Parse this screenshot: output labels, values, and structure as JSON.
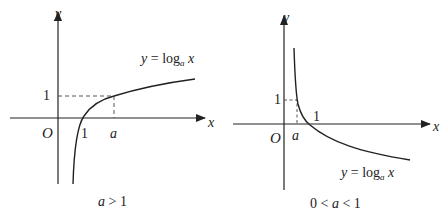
{
  "figures": [
    {
      "id": "left",
      "condition": "a > 1",
      "condition_parts": {
        "a": "a",
        "op": " > ",
        "one": "1"
      },
      "function_label": {
        "y": "y",
        "eq": " = ",
        "log": "log",
        "base": "a",
        "x": " x"
      },
      "axis_labels": {
        "x": "x",
        "y": "y",
        "origin": "O"
      },
      "tick_labels": {
        "x_one": "1",
        "x_a": "a",
        "y_one": "1"
      }
    },
    {
      "id": "right",
      "condition": "0 < a < 1",
      "condition_parts": {
        "zero": "0",
        "op1": " < ",
        "a": "a",
        "op2": " < ",
        "one": "1"
      },
      "function_label": {
        "y": "y",
        "eq": " = ",
        "log": "log",
        "base": "a",
        "x": " x"
      },
      "axis_labels": {
        "x": "x",
        "y": "y",
        "origin": "O"
      },
      "tick_labels": {
        "x_one": "1",
        "x_a": "a",
        "y_one": "1"
      }
    }
  ],
  "colors": {
    "stroke": "#222222",
    "background": "#ffffff"
  }
}
